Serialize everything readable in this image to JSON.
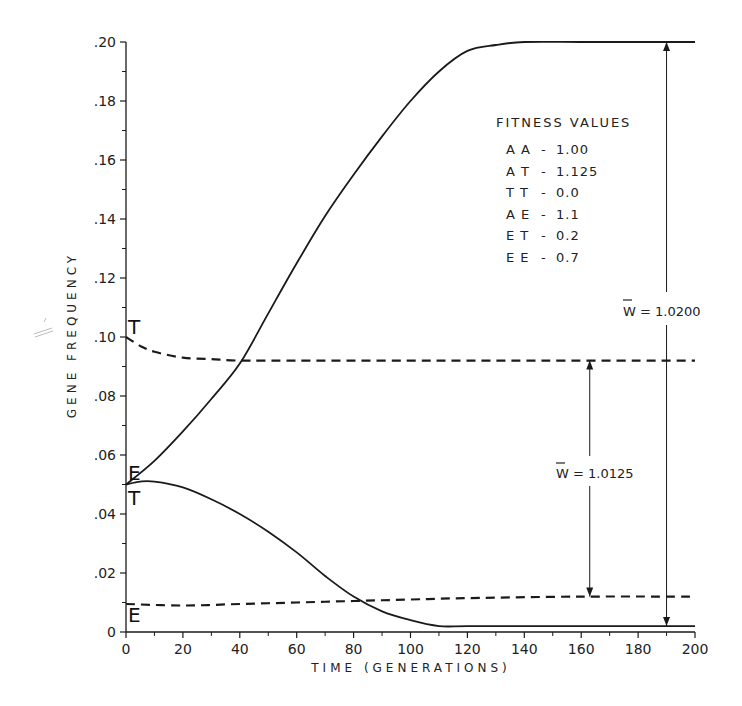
{
  "chart_data": {
    "type": "line",
    "title": "",
    "xlabel": "TIME (GENERATIONS)",
    "ylabel": "GENE FREQUENCY",
    "xlim": [
      0,
      200
    ],
    "ylim": [
      0,
      0.2
    ],
    "x_ticks": [
      "0",
      "20",
      "40",
      "60",
      "80",
      "100",
      "120",
      "140",
      "160",
      "180",
      "200"
    ],
    "y_ticks": [
      "0",
      ".02",
      ".04",
      ".06",
      ".08",
      ".10",
      ".12",
      ".14",
      ".16",
      ".18",
      ".20"
    ],
    "grid": false,
    "series": [
      {
        "name": "E",
        "style": "solid",
        "x": [
          0,
          10,
          20,
          30,
          40,
          50,
          60,
          70,
          80,
          90,
          100,
          110,
          120,
          130,
          140,
          160,
          180,
          200
        ],
        "values": [
          0.05,
          0.058,
          0.068,
          0.079,
          0.091,
          0.108,
          0.125,
          0.141,
          0.155,
          0.168,
          0.18,
          0.19,
          0.197,
          0.199,
          0.2,
          0.2,
          0.2,
          0.2
        ]
      },
      {
        "name": "T",
        "style": "solid",
        "x": [
          0,
          5,
          10,
          20,
          30,
          40,
          50,
          60,
          70,
          80,
          90,
          100,
          110,
          120,
          140,
          160,
          180,
          200
        ],
        "values": [
          0.05,
          0.051,
          0.051,
          0.049,
          0.045,
          0.04,
          0.034,
          0.027,
          0.019,
          0.012,
          0.007,
          0.004,
          0.002,
          0.002,
          0.002,
          0.002,
          0.002,
          0.002
        ]
      },
      {
        "name": "T",
        "style": "dashed",
        "x": [
          0,
          5,
          10,
          20,
          30,
          40,
          60,
          100,
          140,
          200
        ],
        "values": [
          0.1,
          0.097,
          0.095,
          0.093,
          0.0925,
          0.092,
          0.092,
          0.092,
          0.092,
          0.092
        ]
      },
      {
        "name": "E",
        "style": "dashed",
        "x": [
          0,
          20,
          40,
          60,
          80,
          100,
          120,
          160,
          200
        ],
        "values": [
          0.0095,
          0.009,
          0.0095,
          0.01,
          0.0105,
          0.011,
          0.0115,
          0.012,
          0.012
        ]
      }
    ],
    "annotations": [
      {
        "text": "W̄ = 1.0200",
        "arrow_x": 190,
        "from": 0.002,
        "to": 0.2
      },
      {
        "text": "W̄ = 1.0125",
        "arrow_x": 163,
        "from": 0.012,
        "to": 0.092
      }
    ],
    "legend": {
      "title": "FITNESS VALUES",
      "position": "upper-right",
      "entries": [
        {
          "genotype": "AA",
          "value": "1.00"
        },
        {
          "genotype": "AT",
          "value": "1.125"
        },
        {
          "genotype": "TT",
          "value": "0.0"
        },
        {
          "genotype": "AE",
          "value": "1.1"
        },
        {
          "genotype": "ET",
          "value": "0.2"
        },
        {
          "genotype": "EE",
          "value": "0.7"
        }
      ]
    }
  },
  "labels": {
    "curve_T_dashed": "T",
    "curve_E_solid": "E",
    "curve_T_solid": "T",
    "curve_E_dashed": "E",
    "w1": "W = 1.0200",
    "w2": "W = 1.0125"
  },
  "style": {
    "ink": "#1a1a1a",
    "background": "#ffffff"
  }
}
